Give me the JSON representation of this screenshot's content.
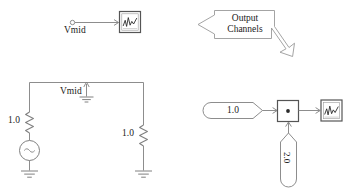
{
  "diagram": {
    "stroke_color": "#808080",
    "text_color": "#1a1a1a",
    "background": "#ffffff"
  },
  "top_left_probe": {
    "signal_label": "Vmid",
    "port_icon": "open-circle-port-icon",
    "scope_icon": "scope-waveform-icon"
  },
  "callout": {
    "line1": "Output",
    "line2": "Channels",
    "left_arrow_icon": "arrow-left-icon",
    "corner_arrow_icon": "arrow-down-right-icon"
  },
  "circuit": {
    "node_label": "Vmid",
    "left_resistor_label": "1.0",
    "right_resistor_label": "1.0",
    "source_icon": "ac-voltage-source-icon",
    "ground_icon": "ground-icon",
    "probe_arrow_icon": "arrow-up-icon",
    "left_resistor_icon": "resistor-icon",
    "right_resistor_icon": "resistor-icon"
  },
  "block_diagram": {
    "const_a_value": "1.0",
    "const_b_value": "2.0",
    "product_symbol": "*",
    "product_icon": "multiply-block-icon",
    "scope_icon": "scope-waveform-icon",
    "const_a_icon": "constant-block-icon",
    "const_b_icon": "constant-block-icon"
  }
}
